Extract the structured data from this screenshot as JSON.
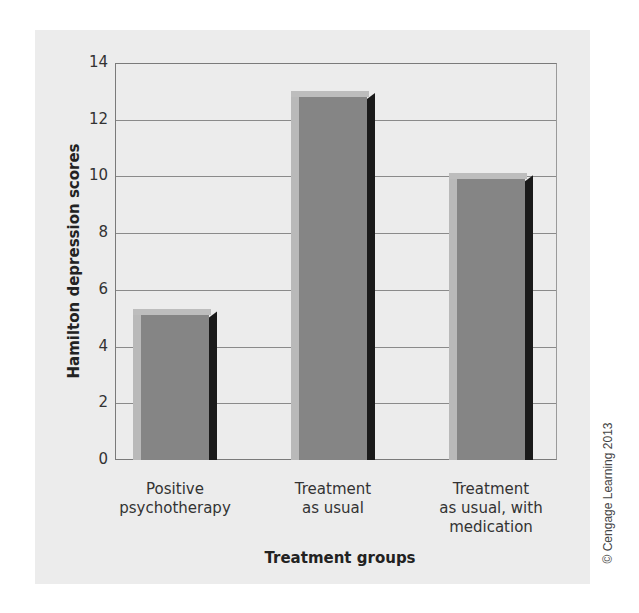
{
  "chart_data": {
    "type": "bar",
    "title": "",
    "xlabel": "Treatment groups",
    "ylabel": "Hamilton depression scores",
    "categories": [
      "Positive psychotherapy",
      "Treatment as usual",
      "Treatment as usual, with medication"
    ],
    "category_lines": [
      [
        "Positive",
        "psychotherapy"
      ],
      [
        "Treatment",
        "as usual"
      ],
      [
        "Treatment",
        "as usual, with",
        "medication"
      ]
    ],
    "values": [
      5.1,
      12.8,
      9.9
    ],
    "ylim": [
      0,
      14
    ],
    "yticks": [
      0,
      2,
      4,
      6,
      8,
      10,
      12,
      14
    ],
    "grid": true,
    "legend": null,
    "style": "3d-shaded-bars"
  },
  "credit": "© Cengage Learning 2013",
  "colors": {
    "panel_bg": "#ececec",
    "bar_face": "#858585",
    "bar_highlight": "#b9b9b9",
    "bar_shadow": "#1a1a1a",
    "gridline": "#8a8a8a"
  }
}
